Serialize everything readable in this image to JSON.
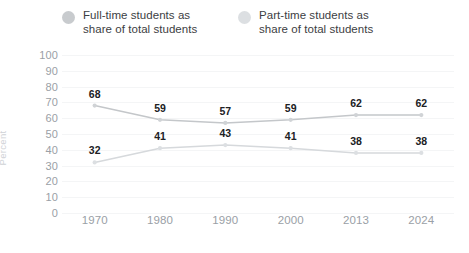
{
  "chart_data": {
    "type": "line",
    "title": "",
    "subtitle": "",
    "xlabel": "",
    "ylabel": "Percent",
    "categories": [
      "1970",
      "1980",
      "1990",
      "2000",
      "2013",
      "2024"
    ],
    "series": [
      {
        "name": "Full-time students as\nshare of total students",
        "values": [
          68,
          59,
          57,
          59,
          62,
          62
        ],
        "color": "#c4c7ca",
        "marker_color": "#d0d3d6",
        "legend_dot_color": "#c8cbce"
      },
      {
        "name": "Part-time students as\nshare of total students",
        "values": [
          32,
          41,
          43,
          41,
          38,
          38
        ],
        "color": "#d6d9dc",
        "marker_color": "#dcdfe2",
        "legend_dot_color": "#dcdfe2"
      }
    ],
    "ylim": [
      0,
      100
    ],
    "y_ticks": [
      100,
      90,
      80,
      70,
      60,
      50,
      40,
      30,
      20,
      10,
      0
    ],
    "grid": true,
    "grid_color": "#f4f5f6",
    "legend_position": "top",
    "data_labels": true,
    "background": "#ffffff",
    "tick_label_color": "#9aa0a6",
    "data_label_color": "#202124",
    "axis_title_color": "#cfd2d6"
  },
  "legend": {
    "items": [
      {
        "label": "Full-time students as\nshare of total students"
      },
      {
        "label": "Part-time students as\nshare of total students"
      }
    ]
  }
}
